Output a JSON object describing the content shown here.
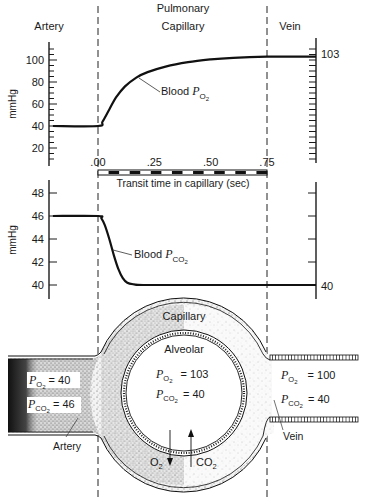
{
  "header": {
    "region_top": "Pulmonary",
    "region_artery": "Artery",
    "region_capillary": "Capillary",
    "region_vein": "Vein"
  },
  "chart_data": [
    {
      "type": "line",
      "title": "",
      "ylabel": "mmHg",
      "xlabel": "Transit time in capillary (sec)",
      "ylim": [
        10,
        115
      ],
      "yticks": [
        20,
        40,
        60,
        80,
        100
      ],
      "ytick_labels": [
        "20",
        "40",
        "60",
        "80",
        "100"
      ],
      "xticks": [
        0.0,
        0.25,
        0.5,
        0.75
      ],
      "xtick_labels": [
        ".00",
        ".25",
        ".50",
        ".75"
      ],
      "series": [
        {
          "name": "Blood PO2",
          "label_main": "Blood ",
          "label_sym": "P",
          "label_sub": "O2",
          "x": [
            -0.2,
            0.0,
            0.02,
            0.05,
            0.08,
            0.12,
            0.17,
            0.22,
            0.3,
            0.4,
            0.5,
            0.6,
            0.75,
            0.92
          ],
          "values": [
            40,
            40,
            44,
            55,
            66,
            76,
            84,
            89,
            94,
            98,
            100.5,
            102,
            103,
            103
          ]
        }
      ],
      "end_value_label": "103"
    },
    {
      "type": "line",
      "title": "",
      "ylabel": "mmHg",
      "ylim": [
        39,
        49
      ],
      "yticks": [
        40,
        42,
        44,
        46,
        48
      ],
      "ytick_labels": [
        "40",
        "42",
        "44",
        "46",
        "48"
      ],
      "series": [
        {
          "name": "Blood PCO2",
          "label_main": "Blood ",
          "label_sym": "P",
          "label_sub": "CO2",
          "x": [
            -0.2,
            0.0,
            0.015,
            0.03,
            0.05,
            0.07,
            0.09,
            0.11,
            0.13,
            0.16,
            0.2,
            0.4,
            0.75,
            0.92
          ],
          "values": [
            46,
            46,
            45.8,
            45.2,
            44.0,
            42.6,
            41.4,
            40.6,
            40.2,
            40.05,
            40,
            40,
            40,
            40
          ]
        }
      ],
      "end_value_label": "40"
    }
  ],
  "timeline": {
    "label": "Transit time in capillary (sec)"
  },
  "diagram": {
    "capillary_label": "Capillary",
    "alveolar_label": "Alveolar",
    "alveolar_po2": "= 103",
    "alveolar_pco2": "= 40",
    "artery_po2": "= 40",
    "artery_pco2": "= 46",
    "vein_po2": "= 100",
    "vein_pco2": "= 40",
    "artery_label": "Artery",
    "vein_label": "Vein",
    "o2_arrow_label": "O",
    "o2_sub": "2",
    "co2_arrow_label": "CO",
    "co2_sub": "2",
    "p_symbol": "P",
    "sub_o2": "O2",
    "sub_co2": "CO2"
  }
}
